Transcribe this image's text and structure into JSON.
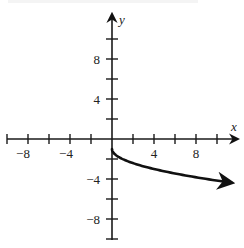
{
  "chart_data": {
    "type": "line",
    "title": "",
    "xlabel": "x",
    "ylabel": "y",
    "xlim": [
      -10,
      12
    ],
    "ylim": [
      -10,
      12
    ],
    "x_ticks": [
      -10,
      -8,
      -6,
      -4,
      -2,
      2,
      4,
      6,
      8,
      10
    ],
    "y_ticks": [
      -10,
      -8,
      -6,
      -4,
      -2,
      2,
      4,
      6,
      8,
      10
    ],
    "x_tick_labels": [
      "-8",
      "-4",
      "4",
      "8"
    ],
    "y_tick_labels": [
      "8",
      "4",
      "-4",
      "-8"
    ],
    "grid": false,
    "legend": null,
    "series": [
      {
        "name": "y = -1 - sqrt(x)",
        "x": [
          0,
          0.25,
          1,
          2,
          3,
          4,
          5,
          6,
          7,
          8,
          9,
          10,
          11.4
        ],
        "y": [
          -1,
          -1.5,
          -2,
          -2.41,
          -2.73,
          -3,
          -3.24,
          -3.45,
          -3.65,
          -3.83,
          -4,
          -4.16,
          -4.38
        ],
        "endpoint_start": "closed",
        "endpoint_end": "arrow"
      }
    ]
  },
  "labels": {
    "x_axis_name": "x",
    "y_axis_name": "y",
    "x_neg8": "−8",
    "x_neg4": "−4",
    "x_pos4": "4",
    "x_pos8": "8",
    "y_pos8": "8",
    "y_pos4": "4",
    "y_neg4": "−4",
    "y_neg8": "−8"
  }
}
